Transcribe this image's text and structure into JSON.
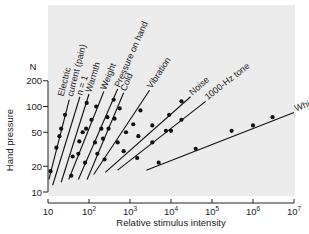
{
  "chart_data": {
    "type": "line",
    "title": "",
    "xlabel": "Relative stimulus intensity",
    "ylabel": "Hand pressure",
    "yunit": "N",
    "xscale": "log",
    "yscale": "log",
    "xlim": [
      10,
      10000000
    ],
    "ylim": [
      10,
      200
    ],
    "xticks": [
      {
        "value": 10,
        "base": "10",
        "exp": ""
      },
      {
        "value": 100,
        "base": "10",
        "exp": "2"
      },
      {
        "value": 1000,
        "base": "10",
        "exp": "3"
      },
      {
        "value": 10000,
        "base": "10",
        "exp": "4"
      },
      {
        "value": 100000,
        "base": "10",
        "exp": "5"
      },
      {
        "value": 1000000,
        "base": "10",
        "exp": "6"
      },
      {
        "value": 10000000,
        "base": "10",
        "exp": "7"
      }
    ],
    "yticks": [
      {
        "value": 10,
        "label": "10"
      },
      {
        "value": 20,
        "label": "20"
      },
      {
        "value": 50,
        "label": "50"
      },
      {
        "value": 100,
        "label": "100"
      },
      {
        "value": 200,
        "label": "200"
      }
    ],
    "grid": false,
    "legend": "inline labels",
    "background_color": "#ececec",
    "series": [
      {
        "name": "Electric current (pain)",
        "label_lines": [
          "Electric",
          "current (pain)"
        ],
        "line": [
          [
            10.5,
            14
          ],
          [
            33,
            120
          ]
        ],
        "points": [
          [
            11.5,
            17.5
          ],
          [
            16,
            33
          ],
          [
            19,
            45
          ],
          [
            21,
            55
          ],
          [
            26,
            80
          ]
        ]
      },
      {
        "name": "n = 1",
        "label_lines": [
          "n = 1"
        ],
        "line": [
          [
            13,
            12
          ],
          [
            60,
            130
          ]
        ],
        "points": []
      },
      {
        "name": "Warmth",
        "label_lines": [
          "Warmth"
        ],
        "line": [
          [
            21,
            13
          ],
          [
            100,
            140
          ]
        ],
        "points": [
          [
            37,
            15.5
          ],
          [
            55,
            28
          ],
          [
            70,
            50
          ],
          [
            88,
            110
          ]
        ]
      },
      {
        "name": "Weight",
        "label_lines": [
          "Weight"
        ],
        "line": [
          [
            32,
            14
          ],
          [
            230,
            150
          ]
        ],
        "points": [
          [
            40,
            26
          ],
          [
            58,
            39
          ],
          [
            85,
            55
          ],
          [
            115,
            70
          ],
          [
            150,
            100
          ]
        ]
      },
      {
        "name": "Pressure on hand",
        "label_lines": [
          "Pressure on hand"
        ],
        "line": [
          [
            55,
            14
          ],
          [
            500,
            160
          ]
        ],
        "points": [
          [
            80,
            22
          ],
          [
            140,
            38
          ],
          [
            200,
            55
          ],
          [
            280,
            75
          ],
          [
            400,
            120
          ]
        ]
      },
      {
        "name": "Cold",
        "label_lines": [
          "Cold"
        ],
        "line": [
          [
            90,
            14
          ],
          [
            700,
            145
          ]
        ],
        "points": [
          [
            160,
            28
          ],
          [
            220,
            42
          ],
          [
            300,
            55
          ],
          [
            420,
            72
          ],
          [
            560,
            95
          ]
        ]
      },
      {
        "name": "Vibration",
        "label_lines": [
          "Vibration"
        ],
        "line": [
          [
            130,
            16
          ],
          [
            3000,
            155
          ]
        ],
        "points": [
          [
            240,
            24
          ],
          [
            500,
            38
          ],
          [
            800,
            50
          ],
          [
            1200,
            62
          ],
          [
            1800,
            90
          ]
        ]
      },
      {
        "name": "Noise",
        "label_lines": [
          "Noise"
        ],
        "line": [
          [
            250,
            17
          ],
          [
            30000,
            130
          ]
        ],
        "points": [
          [
            700,
            30
          ],
          [
            1600,
            45
          ],
          [
            3500,
            60
          ],
          [
            9000,
            80
          ],
          [
            18000,
            115
          ]
        ]
      },
      {
        "name": "1000-Hz tone",
        "label_lines": [
          "1000-Hz tone"
        ],
        "line": [
          [
            500,
            18
          ],
          [
            70000,
            115
          ]
        ],
        "points": [
          [
            1500,
            25
          ],
          [
            3500,
            38
          ],
          [
            7500,
            52
          ],
          [
            10000,
            52
          ],
          [
            18000,
            70
          ]
        ]
      },
      {
        "name": "White light",
        "label_lines": [
          "White light"
        ],
        "line": [
          [
            2500,
            18
          ],
          [
            10000000,
            85
          ]
        ],
        "points": [
          [
            5000,
            22
          ],
          [
            40000,
            32
          ],
          [
            300000,
            52
          ],
          [
            1000000,
            60
          ],
          [
            3000000,
            75
          ]
        ]
      }
    ]
  }
}
